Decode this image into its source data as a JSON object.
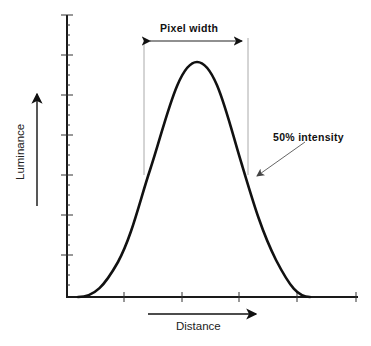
{
  "diagram": {
    "title": "Pixel width",
    "annotation": "50%  intensity",
    "x_axis_label": "Distance",
    "y_axis_label": "Luminance",
    "colors": {
      "curve": "#111111",
      "axis": "#1a1a1a",
      "guide": "#aaaaaa",
      "arrow": "#666666"
    },
    "curve": {
      "shape": "gaussian-like bell",
      "start_x_px": 78,
      "end_x_px": 310,
      "peak_x_px": 197,
      "peak_y_px": 62,
      "baseline_y_px": 297
    },
    "half_max_guides_x_px": [
      144,
      248
    ],
    "x_ticks_px": [
      66,
      124,
      182,
      239,
      297,
      356
    ],
    "y_major_ticks_px": [
      15,
      55,
      95,
      135,
      175,
      215,
      255,
      297
    ]
  }
}
